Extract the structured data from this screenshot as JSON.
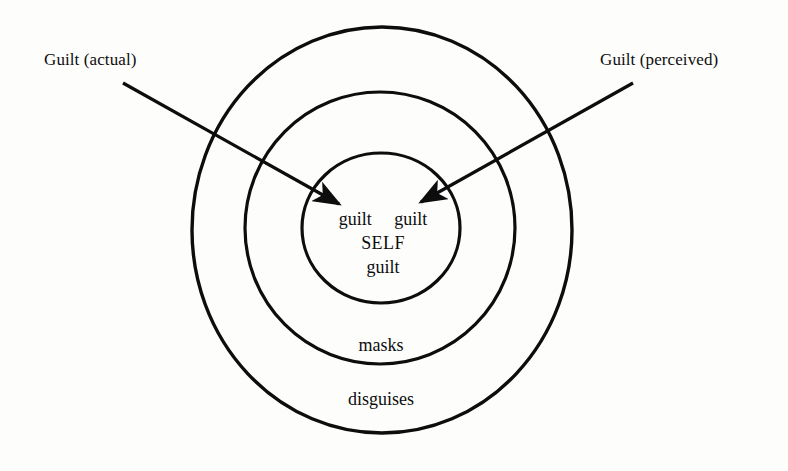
{
  "diagram": {
    "background_color": "#fdfdfc",
    "ink_color": "#0d0d0d",
    "callouts": [
      {
        "id": "guilt-actual",
        "label": "Guilt (actual)",
        "arrow_from": [
          123,
          83
        ],
        "arrow_to": [
          342,
          206
        ]
      },
      {
        "id": "guilt-perceived",
        "label": "Guilt (perceived)",
        "arrow_from": [
          633,
          83
        ],
        "arrow_to": [
          418,
          204
        ]
      }
    ],
    "rings": [
      {
        "id": "outer-ring",
        "label": "disguises",
        "cx": 382,
        "cy": 230,
        "rx": 190,
        "ry": 203
      },
      {
        "id": "middle-ring",
        "label": "masks",
        "cx": 380,
        "cy": 228,
        "rx": 135,
        "ry": 136
      },
      {
        "id": "inner-ring",
        "label": "",
        "cx": 381,
        "cy": 228,
        "rx": 79,
        "ry": 75
      }
    ],
    "center": {
      "top_left_word": "guilt",
      "top_right_word": "guilt",
      "self_word": "SELF",
      "bottom_word": "guilt",
      "top_row": "guilt     guilt"
    }
  }
}
